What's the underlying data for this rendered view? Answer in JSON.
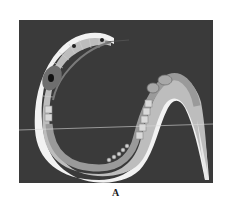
{
  "figure": {
    "panel_label": "A",
    "colors": {
      "background": "#3a3a3a",
      "cuticle": "#f2f2f2",
      "body_fill": "#bdbdbd",
      "intestine": "#9a9a9a",
      "gonad_cells": "#d9d9d9",
      "pharynx_bulb": "#6e6e6e",
      "guide_line": "#d8d8d8"
    },
    "parts": [
      "head",
      "pharynx",
      "pharyngeal-bulb",
      "gonad",
      "embryos",
      "oocytes",
      "intestine",
      "tail"
    ]
  }
}
